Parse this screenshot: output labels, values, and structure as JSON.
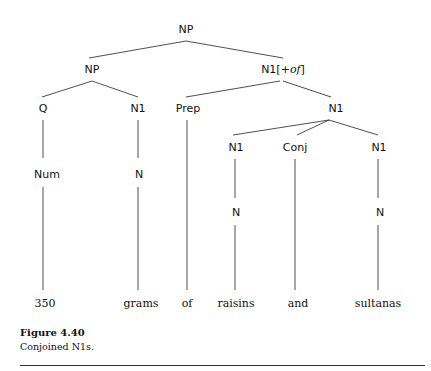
{
  "tree": {
    "nodes": {
      "root": "NP",
      "np": "NP",
      "n1of_base": "N1[+",
      "n1of_feat": "of",
      "n1of_close": "]",
      "q": "Q",
      "n1_left": "N1",
      "prep": "Prep",
      "n1_right": "N1",
      "n1_a": "N1",
      "conj": "Conj",
      "n1_b": "N1",
      "num": "Num",
      "n_left": "N",
      "n_a": "N",
      "n_b": "N"
    },
    "leaves": [
      "350",
      "grams",
      "of",
      "raisins",
      "and",
      "sultanas"
    ]
  },
  "caption": {
    "title": "Figure 4.40",
    "text": "Conjoined N1s."
  }
}
